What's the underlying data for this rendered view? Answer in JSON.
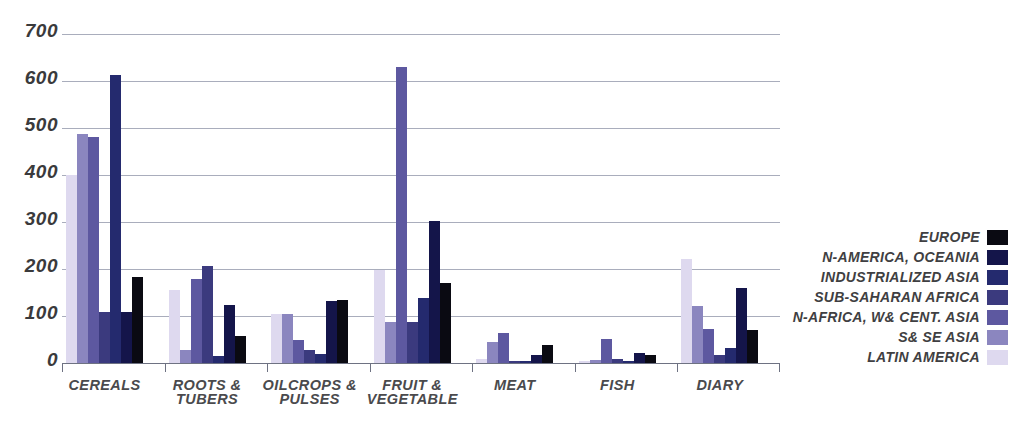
{
  "chart_data": {
    "type": "bar",
    "title": "",
    "subtitle": "",
    "xlabel": "",
    "ylabel": "",
    "ylim": [
      0,
      700
    ],
    "yticks": [
      0,
      100,
      200,
      300,
      400,
      500,
      600,
      700
    ],
    "ytick_labels": [
      "0",
      "100",
      "200",
      "300",
      "400",
      "500",
      "600",
      "700"
    ],
    "grid": true,
    "legend_position": "right",
    "categories": [
      "CEREALS",
      "ROOTS &\nTUBERS",
      "OILCROPS &\nPULSES",
      "FRUIT &\nVEGETABLE",
      "MEAT",
      "FISH",
      "DIARY"
    ],
    "bar_order_note": "Within each group bars are drawn in reverse legend order: LATIN AMERICA first (leftmost, lightest) through EUROPE last (rightmost, black).",
    "series": [
      {
        "name": "EUROPE",
        "color": "#0a0a12",
        "values": [
          183,
          58,
          134,
          170,
          38,
          18,
          70
        ]
      },
      {
        "name": "N-AMERICA, OCEANIA",
        "color": "#14154a",
        "values": [
          108,
          124,
          132,
          302,
          18,
          22,
          160
        ]
      },
      {
        "name": "INDUSTRIALIZED ASIA",
        "color": "#242a6e",
        "values": [
          613,
          14,
          20,
          138,
          5,
          5,
          32
        ]
      },
      {
        "name": "SUB-SAHARAN AFRICA",
        "color": "#3b3a7e",
        "values": [
          108,
          207,
          28,
          88,
          5,
          8,
          18
        ]
      },
      {
        "name": "N-AFRICA, W& CENT. ASIA",
        "color": "#5d58a0",
        "values": [
          480,
          178,
          48,
          630,
          63,
          52,
          72
        ]
      },
      {
        "name": "S& SE ASIA",
        "color": "#8b86bf",
        "values": [
          487,
          27,
          105,
          88,
          45,
          7,
          122
        ]
      },
      {
        "name": "LATIN AMERICA",
        "color": "#ded9ef",
        "values": [
          400,
          155,
          105,
          198,
          8,
          4,
          222
        ]
      }
    ]
  },
  "legend": {
    "items": [
      {
        "label": "EUROPE",
        "color": "#0a0a12"
      },
      {
        "label": "N-AMERICA, OCEANIA",
        "color": "#14154a"
      },
      {
        "label": "INDUSTRIALIZED ASIA",
        "color": "#242a6e"
      },
      {
        "label": "SUB-SAHARAN AFRICA",
        "color": "#3b3a7e"
      },
      {
        "label": "N-AFRICA, W& CENT. ASIA",
        "color": "#5d58a0"
      },
      {
        "label": "S& SE ASIA",
        "color": "#8b86bf"
      },
      {
        "label": "LATIN AMERICA",
        "color": "#ded9ef"
      }
    ]
  },
  "axis": {
    "y_tick_labels": [
      "700",
      "600",
      "500",
      "400",
      "300",
      "200",
      "100",
      "0"
    ]
  },
  "caption": {
    "text": ""
  },
  "colors": {
    "gridline": "#9a9fb0",
    "axis": "#6e7282",
    "text": "#3a3a3c",
    "background": "#ffffff"
  }
}
